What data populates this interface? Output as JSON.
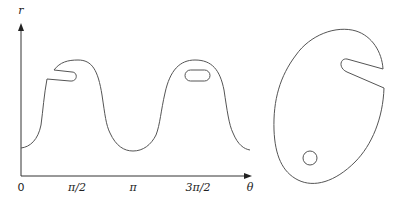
{
  "left_plot": {
    "y_axis_label": "r",
    "x_axis_label": "θ",
    "x_ticks": [
      "0",
      "π/2",
      "π",
      "3π/2"
    ],
    "description": "Graph of r versus θ showing two bumps; the first bump has a slit cut into it, the second has an enclosed oval hole"
  },
  "right_shape": {
    "description": "Closed blob-shaped region with a slot cut in from the right edge and a small circular hole near the lower left"
  },
  "colors": {
    "stroke": "#555555",
    "axis": "#333333",
    "background": "#ffffff"
  }
}
